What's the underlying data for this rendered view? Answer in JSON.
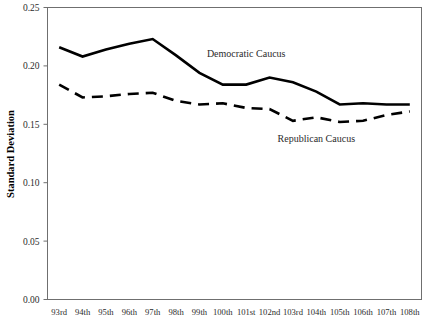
{
  "figure": {
    "clipped_header_text": "",
    "background_color": "#ffffff",
    "line_color": "#000000",
    "axis_color": "#6f6f6f"
  },
  "chart_data": {
    "type": "line",
    "title": "",
    "xlabel": "",
    "ylabel": "Standard Deviation",
    "ylim": [
      0.0,
      0.25
    ],
    "yticks": [
      0.0,
      0.05,
      0.1,
      0.15,
      0.2,
      0.25
    ],
    "ytick_labels": [
      "0.00",
      "0.05",
      "0.10",
      "0.15",
      "0.20",
      "0.25"
    ],
    "grid": false,
    "legend_position": "inline-annotation",
    "categories": [
      "93rd",
      "94th",
      "95th",
      "96th",
      "97th",
      "98th",
      "99th",
      "100th",
      "101st",
      "102nd",
      "103rd",
      "104th",
      "105th",
      "106th",
      "107th",
      "108th"
    ],
    "series": [
      {
        "name": "Democratic Caucus",
        "style": "solid",
        "color": "#000000",
        "values": [
          0.216,
          0.208,
          0.214,
          0.219,
          0.223,
          0.209,
          0.194,
          0.184,
          0.184,
          0.19,
          0.186,
          0.178,
          0.167,
          0.168,
          0.167,
          0.167
        ],
        "annotation": {
          "text": "Democratic Caucus",
          "x_category": "101st",
          "y_value": 0.208
        }
      },
      {
        "name": "Republican Caucus",
        "style": "dashed",
        "color": "#000000",
        "values": [
          0.184,
          0.173,
          0.174,
          0.176,
          0.177,
          0.17,
          0.167,
          0.168,
          0.164,
          0.163,
          0.153,
          0.156,
          0.152,
          0.153,
          0.158,
          0.161
        ],
        "annotation": {
          "text": "Republican Caucus",
          "x_category": "104th",
          "y_value": 0.135
        }
      }
    ]
  }
}
